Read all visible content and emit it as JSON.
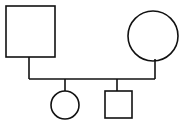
{
  "diagram": {
    "type": "pedigree",
    "colors": {
      "stroke": "#111111",
      "fill": "#ffffff",
      "background": "#ffffff"
    },
    "parents": [
      {
        "id": "father",
        "shape": "square",
        "sex": "male",
        "x": 6,
        "y": 6,
        "w": 49,
        "h": 51
      },
      {
        "id": "mother",
        "shape": "circle",
        "sex": "female",
        "cx": 153,
        "cy": 36,
        "r": 25
      }
    ],
    "children": [
      {
        "id": "daughter",
        "shape": "circle",
        "sex": "female",
        "cx": 65,
        "cy": 105,
        "r": 14
      },
      {
        "id": "son",
        "shape": "square",
        "sex": "male",
        "x": 105,
        "y": 91,
        "w": 27,
        "h": 27
      }
    ],
    "lines": {
      "marriage_y": 79,
      "father_stem_x": 29,
      "mother_stem_x": 155,
      "daughter_stem_x": 65,
      "son_stem_x": 117
    }
  }
}
